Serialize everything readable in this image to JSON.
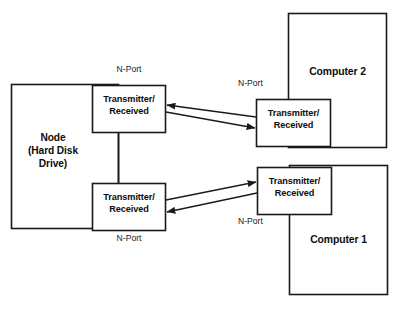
{
  "diagram": {
    "stroke_color": "#1a1a1a",
    "fill_color": "#ffffff",
    "text_color": "#0d0d0d",
    "nodes": {
      "node_device": {
        "label": "Node\n(Hard Disk\nDrive)",
        "line1": "Node",
        "line2": "(Hard Disk",
        "line3": "Drive)"
      },
      "computer_2": {
        "label": "Computer 2"
      },
      "computer_1": {
        "label": "Computer 1"
      },
      "node_upper_port": {
        "label": "Transmitter/\nReceived",
        "line1": "Transmitter/",
        "line2": "Received"
      },
      "node_lower_port": {
        "label": "Transmitter/\nReceived",
        "line1": "Transmitter/",
        "line2": "Received"
      },
      "computer2_port": {
        "label": "Transmitter/\nReceived",
        "line1": "Transmitter/",
        "line2": "Received"
      },
      "computer1_port": {
        "label": "Transmitter/\nReceived",
        "line1": "Transmitter/",
        "line2": "Received"
      }
    },
    "port_labels": {
      "node_upper": "N-Port",
      "node_lower": "N-Port",
      "computer2": "N-Port",
      "computer1": "N-Port"
    },
    "links": [
      {
        "name": "computer2-to-node-upper",
        "from": "computer2_port",
        "to": "node_upper_port",
        "direction": "left"
      },
      {
        "name": "node-upper-to-computer2",
        "from": "node_upper_port",
        "to": "computer2_port",
        "direction": "right"
      },
      {
        "name": "node-lower-to-computer1",
        "from": "node_lower_port",
        "to": "computer1_port",
        "direction": "right"
      },
      {
        "name": "computer1-to-node-lower",
        "from": "computer1_port",
        "to": "node_lower_port",
        "direction": "left"
      }
    ]
  }
}
